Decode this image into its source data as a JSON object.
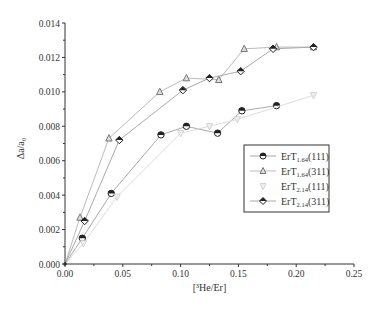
{
  "chart_data": {
    "type": "line",
    "title": "",
    "xlabel": "[³He/Er]",
    "ylabel": "Δa/a₀",
    "xlim": [
      0.0,
      0.25
    ],
    "ylim": [
      0.0,
      0.014
    ],
    "xticks": [
      "0.00",
      "0.05",
      "0.10",
      "0.15",
      "0.20",
      "0.25"
    ],
    "yticks": [
      "0.000",
      "0.002",
      "0.004",
      "0.006",
      "0.008",
      "0.010",
      "0.012",
      "0.014"
    ],
    "grid": false,
    "legend_position": "right-middle",
    "series": [
      {
        "name": "ErT1.64(111)",
        "label_main": "ErT",
        "label_sub": "1.64",
        "label_tail": "(111)",
        "marker": "half-filled-circle",
        "color": "#222222",
        "line_color": "#aaaaaa",
        "x": [
          0.0,
          0.015,
          0.04,
          0.083,
          0.105,
          0.132,
          0.153,
          0.183
        ],
        "y": [
          0.0,
          0.0015,
          0.0041,
          0.0075,
          0.008,
          0.0076,
          0.0089,
          0.0092
        ]
      },
      {
        "name": "ErT1.64(311)",
        "label_main": "ErT",
        "label_sub": "1.64",
        "label_tail": "(311)",
        "marker": "triangle",
        "color": "#777777",
        "line_color": "#bbbbbb",
        "x": [
          0.0,
          0.013,
          0.038,
          0.082,
          0.105,
          0.133,
          0.155,
          0.183,
          0.215
        ],
        "y": [
          0.0,
          0.0027,
          0.0073,
          0.01,
          0.0108,
          0.0107,
          0.0125,
          0.0126,
          0.0126
        ]
      },
      {
        "name": "ErT2.14(111)",
        "label_main": "ErT",
        "label_sub": "2.14",
        "label_tail": "(111)",
        "marker": "inverted-triangle",
        "color": "#cccccc",
        "line_color": "#dddddd",
        "x": [
          0.0,
          0.016,
          0.045,
          0.1,
          0.125,
          0.149,
          0.215
        ],
        "y": [
          0.0,
          0.0012,
          0.0039,
          0.0076,
          0.008,
          0.0084,
          0.0098
        ]
      },
      {
        "name": "ErT2.14(311)",
        "label_main": "ErT",
        "label_sub": "2.14",
        "label_tail": "(311)",
        "marker": "half-filled-diamond",
        "color": "#222222",
        "line_color": "#aaaaaa",
        "x": [
          0.0,
          0.017,
          0.047,
          0.102,
          0.125,
          0.152,
          0.18,
          0.215
        ],
        "y": [
          0.0,
          0.0025,
          0.0072,
          0.0101,
          0.0108,
          0.0112,
          0.0125,
          0.0126
        ]
      }
    ]
  }
}
